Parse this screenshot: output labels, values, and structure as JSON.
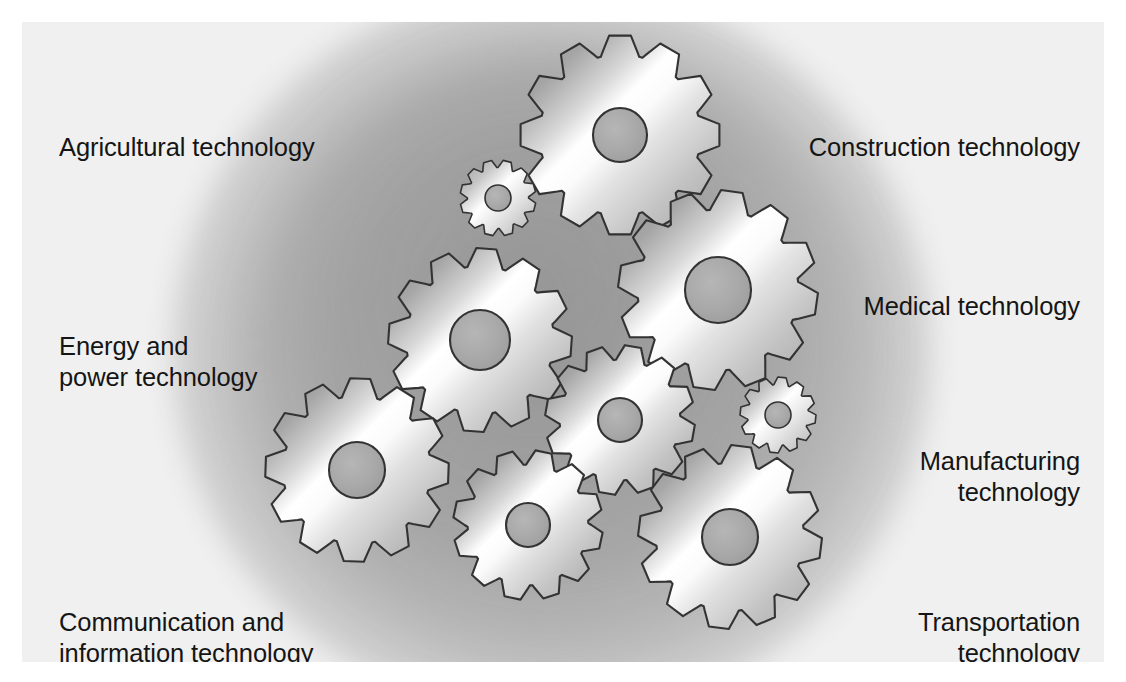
{
  "diagram": {
    "type": "gear-cluster-diagram",
    "background_color": "#f0f0f0",
    "page_color": "#ffffff",
    "text_color": "#151515"
  },
  "labels": {
    "agricultural": "Agricultural technology",
    "energy": "Energy and\npower technology",
    "communication": "Communication and\ninformation technology",
    "construction": "Construction technology",
    "medical": "Medical technology",
    "manufacturing": "Manufacturing\ntechnology",
    "transportation": "Transportation\ntechnology"
  },
  "gears": [
    {
      "name": "gear-top",
      "cx": 620,
      "cy": 135,
      "r": 100,
      "hub": 27,
      "teeth": 12,
      "phase": 0
    },
    {
      "name": "gear-small-upper",
      "cx": 498,
      "cy": 198,
      "r": 38,
      "hub": 13,
      "teeth": 12,
      "phase": 14
    },
    {
      "name": "gear-right",
      "cx": 718,
      "cy": 290,
      "r": 100,
      "hub": 33,
      "teeth": 12,
      "phase": 8
    },
    {
      "name": "gear-mid-left",
      "cx": 480,
      "cy": 340,
      "r": 92,
      "hub": 30,
      "teeth": 12,
      "phase": 4
    },
    {
      "name": "gear-center",
      "cx": 620,
      "cy": 420,
      "r": 75,
      "hub": 22,
      "teeth": 12,
      "phase": 10
    },
    {
      "name": "gear-small-right",
      "cx": 778,
      "cy": 415,
      "r": 38,
      "hub": 13,
      "teeth": 12,
      "phase": 6
    },
    {
      "name": "gear-left",
      "cx": 357,
      "cy": 470,
      "r": 92,
      "hub": 28,
      "teeth": 12,
      "phase": 2
    },
    {
      "name": "gear-bottom-center",
      "cx": 528,
      "cy": 525,
      "r": 75,
      "hub": 22,
      "teeth": 12,
      "phase": 12
    },
    {
      "name": "gear-lower-right",
      "cx": 730,
      "cy": 537,
      "r": 92,
      "hub": 28,
      "teeth": 12,
      "phase": 7
    }
  ],
  "gear_style": {
    "outline_color": "#333333",
    "gradient_dark": "#9a9a9a",
    "gradient_highlight": "#ffffff",
    "gradient_mid": "#c8c8c8",
    "hub_fill": "#a8a8a8"
  }
}
